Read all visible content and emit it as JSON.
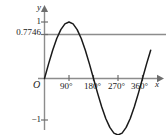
{
  "figure": {
    "background_color": "#ffffff",
    "width": 167,
    "height": 135,
    "axis_color": "#808080",
    "curve_color": "#1a1a1a",
    "reference_line_color": "#8c8c8c",
    "text_color": "#1a1a1a"
  },
  "axes": {
    "y_axis_name": "y",
    "x_axis_name": "x",
    "origin_label": "O"
  },
  "y_ticks": [
    {
      "label": "1",
      "value": 1
    },
    {
      "label": "0.7746",
      "value": 0.7746
    },
    {
      "label": "−1",
      "value": -1
    }
  ],
  "x_ticks": [
    {
      "label": "90°",
      "value": 90
    },
    {
      "label": "180°",
      "value": 180
    },
    {
      "label": "270°",
      "value": 270
    },
    {
      "label": "360°",
      "value": 360
    }
  ],
  "chart_data": {
    "type": "line",
    "title": "",
    "xlabel": "x",
    "ylabel": "y",
    "xlim": [
      -20,
      390
    ],
    "ylim": [
      -1.35,
      1.3
    ],
    "grid": false,
    "legend": null,
    "series": [
      {
        "name": "y = sin x",
        "kind": "curve",
        "color": "#1a1a1a",
        "x": [
          0,
          15,
          30,
          45,
          60,
          75,
          90,
          105,
          120,
          135,
          150,
          165,
          180,
          195,
          210,
          225,
          240,
          255,
          270,
          285,
          300,
          315,
          330,
          345,
          360,
          375,
          390
        ],
        "values": [
          0,
          0.2588,
          0.5,
          0.7071,
          0.866,
          0.9659,
          1,
          0.9659,
          0.866,
          0.7071,
          0.5,
          0.2588,
          0,
          -0.2588,
          -0.5,
          -0.7071,
          -0.866,
          -0.9659,
          -1,
          -0.9659,
          -0.866,
          -0.7071,
          -0.5,
          -0.2588,
          0,
          0.2588,
          0.5
        ]
      },
      {
        "name": "y = 0.7746",
        "kind": "horizontal-line",
        "color": "#8c8c8c",
        "value": 0.7746
      }
    ],
    "annotations": [
      {
        "text": "0.7746",
        "axis": "y",
        "value": 0.7746
      },
      {
        "text": "1",
        "axis": "y",
        "value": 1
      },
      {
        "text": "−1",
        "axis": "y",
        "value": -1
      },
      {
        "text": "O",
        "axis": "origin",
        "value": 0
      }
    ]
  }
}
